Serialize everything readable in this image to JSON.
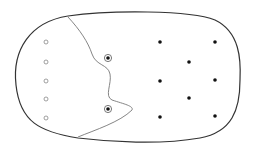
{
  "diagram": {
    "type": "classification-boundary",
    "colors": {
      "outline": "#333333",
      "boundary": "#777777",
      "hollow_point": "#888888",
      "solid_point": "#111111"
    },
    "region": {
      "cx": 127,
      "cy": 76.5,
      "shape": "rounded-oval"
    },
    "hollow_points": [
      {
        "x": 46,
        "y": 42
      },
      {
        "x": 46,
        "y": 62
      },
      {
        "x": 46,
        "y": 81
      },
      {
        "x": 46,
        "y": 99
      },
      {
        "x": 46,
        "y": 118
      }
    ],
    "ringed_points": [
      {
        "x": 108,
        "y": 58
      },
      {
        "x": 108,
        "y": 109
      }
    ],
    "solid_points": [
      {
        "x": 160,
        "y": 42
      },
      {
        "x": 215,
        "y": 42
      },
      {
        "x": 189,
        "y": 62
      },
      {
        "x": 160,
        "y": 81
      },
      {
        "x": 215,
        "y": 80
      },
      {
        "x": 189,
        "y": 98
      },
      {
        "x": 160,
        "y": 117
      },
      {
        "x": 215,
        "y": 116
      }
    ]
  }
}
